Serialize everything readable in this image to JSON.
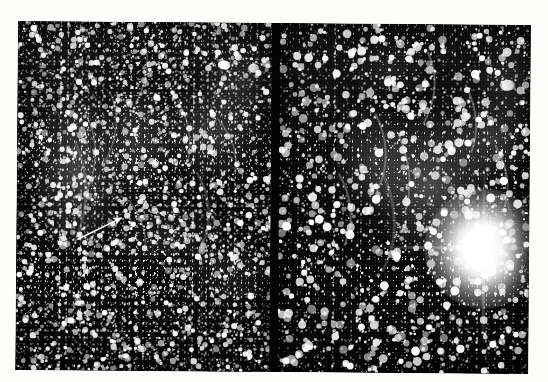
{
  "figure": {
    "kind": "astronomical-photographic-plate",
    "panel_count": 2,
    "background_color": "#050505",
    "page_background": "#ffffff",
    "annotation": {
      "type": "arrow",
      "label": "",
      "color": "#ffffff",
      "tail": {
        "x": 61,
        "y": 218
      },
      "tip": {
        "x": 107,
        "y": 195
      }
    },
    "panels": [
      {
        "name": "left-panel",
        "description": "wide-field star field with faint filamentary nebulosity",
        "x": 0,
        "y": 0,
        "width": 255,
        "height": 349,
        "star_density": "very-high",
        "bright_features": [
          {
            "name": "star-clump-upper-right",
            "x": 206,
            "y": 44,
            "size": 9
          },
          {
            "name": "star-clump-upper-right-2",
            "x": 236,
            "y": 47,
            "size": 8
          },
          {
            "name": "bright-star-a",
            "x": 245,
            "y": 40,
            "size": 7
          },
          {
            "name": "bright-star-b",
            "x": 150,
            "y": 48,
            "size": 5
          },
          {
            "name": "bright-star-c",
            "x": 88,
            "y": 290,
            "size": 5
          },
          {
            "name": "bright-star-d",
            "x": 196,
            "y": 415,
            "size": 4
          }
        ]
      },
      {
        "name": "right-panel",
        "description": "deeper zoom of same region dominated by one saturated bright star",
        "x": 262,
        "y": 0,
        "width": 251,
        "height": 349,
        "star_density": "high",
        "bright_features": [
          {
            "name": "saturated-bright-star",
            "x": 206,
            "y": 224,
            "size": 120
          },
          {
            "name": "star-clump-upper-right",
            "x": 228,
            "y": 62,
            "size": 11
          },
          {
            "name": "bright-star-e",
            "x": 188,
            "y": 118,
            "size": 6
          },
          {
            "name": "bright-star-f",
            "x": 44,
            "y": 34,
            "size": 5
          }
        ]
      }
    ],
    "seam": {
      "name": "panel-seam",
      "x": 254,
      "width": 9,
      "color": "#040404"
    }
  }
}
